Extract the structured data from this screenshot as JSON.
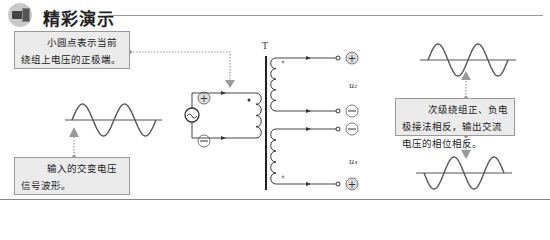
{
  "header": {
    "title": "精彩演示",
    "icon": "camera-icon"
  },
  "callouts": {
    "dot_note": "小圆点表示当前绕组上电压的正极端。",
    "input_note": "输入的交变电压信号波形。",
    "output_note": "次级绕组正、负电极接法相反，输出交流电压的相位相反。"
  },
  "diagram": {
    "transformer_label": "T",
    "input_label": "u₁",
    "output_top_label": "u₂",
    "output_bottom_label": "u₃",
    "input_polarity": {
      "top": "+",
      "bottom": "−"
    },
    "output_top_polarity": {
      "top": "+",
      "bottom": "−"
    },
    "output_bottom_polarity": {
      "top": "−",
      "bottom": "+"
    }
  }
}
